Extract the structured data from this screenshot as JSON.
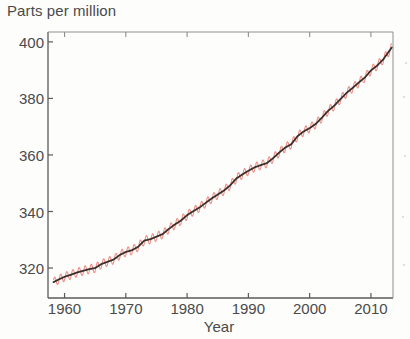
{
  "chart_data": {
    "type": "line",
    "title": "",
    "ylabel": "Parts per million",
    "xlabel": "Year",
    "xlim": [
      1957.3,
      2013.6
    ],
    "ylim": [
      309.4,
      403.5
    ],
    "grid": false,
    "legend": "none",
    "xticks": [
      1960,
      1970,
      1980,
      1990,
      2000,
      2010
    ],
    "xtick_labels": [
      "1960",
      "1970",
      "1980",
      "1990",
      "2000",
      "2010"
    ],
    "yticks": [
      320,
      340,
      360,
      380,
      400
    ],
    "ytick_labels": [
      "320",
      "340",
      "360",
      "380",
      "400"
    ],
    "series": [
      {
        "name": "monthly-seasonal-cycle",
        "color": "#ec9189",
        "style": "line",
        "width": 1.1,
        "description": "Monthly mean CO2 with seasonal oscillation, amplitude about 3 ppm peak-to-peak",
        "seasonal_amplitude_ppm": 3.1
      },
      {
        "name": "smoothed-trend",
        "color": "#3b2f2c",
        "style": "line",
        "width": 1.8,
        "x": [
          1958.2,
          1959,
          1960,
          1961,
          1962,
          1963,
          1964,
          1965,
          1966,
          1967,
          1968,
          1969,
          1970,
          1971,
          1972,
          1973,
          1974,
          1975,
          1976,
          1977,
          1978,
          1979,
          1980,
          1981,
          1982,
          1983,
          1984,
          1985,
          1986,
          1987,
          1988,
          1989,
          1990,
          1991,
          1992,
          1993,
          1994,
          1995,
          1996,
          1997,
          1998,
          1999,
          2000,
          2001,
          2002,
          2003,
          2004,
          2005,
          2006,
          2007,
          2008,
          2009,
          2010,
          2011,
          2012,
          2013.4
        ],
        "values": [
          315.0,
          315.9,
          316.9,
          317.6,
          318.4,
          319.0,
          319.6,
          320.0,
          321.4,
          322.2,
          323.0,
          324.6,
          325.7,
          326.3,
          327.5,
          329.7,
          330.2,
          331.1,
          332.0,
          333.8,
          335.4,
          336.8,
          338.7,
          340.1,
          341.4,
          343.0,
          344.6,
          346.0,
          347.4,
          349.2,
          351.6,
          353.1,
          354.4,
          355.6,
          356.4,
          357.1,
          358.8,
          360.8,
          362.6,
          363.8,
          366.6,
          368.3,
          369.5,
          371.0,
          373.2,
          375.6,
          377.4,
          379.7,
          381.9,
          383.7,
          385.6,
          387.4,
          389.9,
          391.6,
          393.8,
          398.0
        ]
      }
    ]
  },
  "axes": {
    "ylabel_top": "Parts per million",
    "xlabel_bottom": "Year"
  }
}
